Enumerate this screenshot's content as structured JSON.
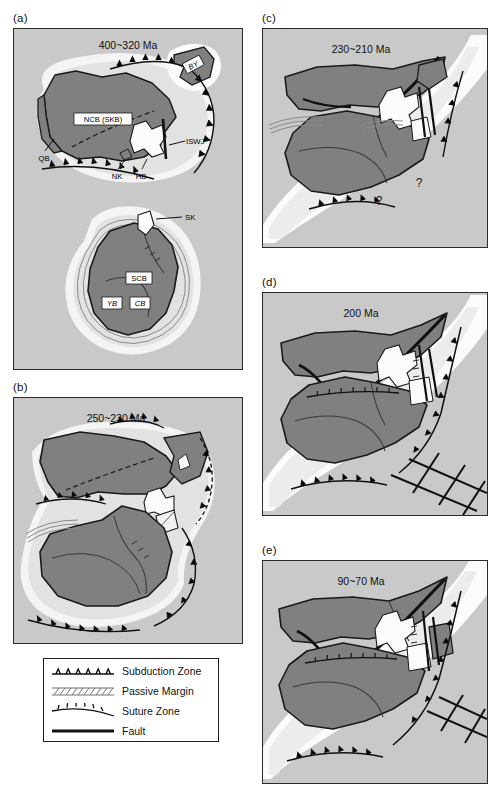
{
  "figure": {
    "type": "tectonic-reconstruction-series",
    "background": "#ffffff"
  },
  "colors": {
    "panel_background": "#c9c9c9",
    "continental_block": "#808080",
    "shelf_white": "#f7f7f7",
    "halo_light": "#e2e2e2",
    "outline": "#1a1a1a",
    "panel_border": "#2b2b2b",
    "legend_background": "#ffffff"
  },
  "panels": [
    {
      "id": "a",
      "label": "(a)",
      "age": "400~320 Ma",
      "blocks": [
        {
          "name": "NCB (SKB)",
          "style": "boxed"
        },
        {
          "name": "QB",
          "style": "plain"
        },
        {
          "name": "ISWJ",
          "style": "plain"
        },
        {
          "name": "NK",
          "style": "plain"
        },
        {
          "name": "HB",
          "style": "plain"
        },
        {
          "name": "BY",
          "style": "boxed-italic"
        },
        {
          "name": "SK",
          "style": "plain"
        },
        {
          "name": "SCB",
          "style": "boxed"
        },
        {
          "name": "YB",
          "style": "boxed-italic"
        },
        {
          "name": "CB",
          "style": "boxed-italic"
        }
      ],
      "question_marks": []
    },
    {
      "id": "b",
      "label": "(b)",
      "age": "250~230 Ma",
      "blocks": [],
      "question_marks": []
    },
    {
      "id": "c",
      "label": "(c)",
      "age": "230~210 Ma",
      "blocks": [],
      "question_marks": [
        "?",
        "?"
      ]
    },
    {
      "id": "d",
      "label": "(d)",
      "age": "200 Ma",
      "blocks": [],
      "question_marks": []
    },
    {
      "id": "e",
      "label": "(e)",
      "age": "90~70 Ma",
      "blocks": [],
      "question_marks": []
    }
  ],
  "legend": {
    "items": [
      {
        "symbol": "subduction-zone",
        "label": "Subduction Zone"
      },
      {
        "symbol": "passive-margin",
        "label": "Passive Margin"
      },
      {
        "symbol": "suture-zone",
        "label": "Suture Zone"
      },
      {
        "symbol": "fault",
        "label": "Fault"
      }
    ]
  }
}
